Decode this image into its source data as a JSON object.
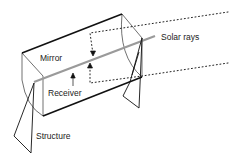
{
  "diagram": {
    "labels": {
      "mirror": "Mirror",
      "receiver": "Receiver",
      "solar_rays": "Solar rays",
      "structure": "Structure"
    },
    "colors": {
      "outline": "#111111",
      "thin_line": "#444444",
      "receiver_tube": "#9a9a9a",
      "rays": "#222222",
      "text": "#222222"
    }
  }
}
